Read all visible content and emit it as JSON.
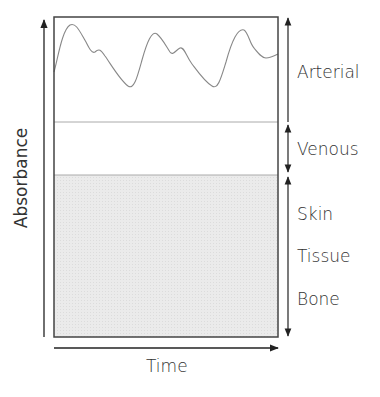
{
  "diagram": {
    "title": "",
    "y_axis_label": "Absorbance",
    "x_axis_label": "Time",
    "regions": [
      {
        "name": "arterial",
        "label": "Arterial",
        "y_top": 17,
        "y_bottom": 122,
        "fill": "#ffffff",
        "note": "pulsatile waveform"
      },
      {
        "name": "venous",
        "label": "Venous",
        "y_top": 122,
        "y_bottom": 175,
        "fill": "#ffffff"
      },
      {
        "name": "static",
        "labels": [
          "Skin",
          "Tissue",
          "Bone"
        ],
        "y_top": 175,
        "y_bottom": 337,
        "fill": "#e9e9e9"
      }
    ],
    "colors": {
      "frame": "#444444",
      "waveform": "#888888",
      "divider": "#aaaaaa",
      "shaded": "#e9e9e9",
      "arrow": "#222222",
      "text": "#333333"
    }
  },
  "labels": {
    "arterial": "Arterial",
    "venous": "Venous",
    "skin": "Skin",
    "tissue": "Tissue",
    "bone": "Bone",
    "absorbance": "Absorbance",
    "time": "Time"
  }
}
